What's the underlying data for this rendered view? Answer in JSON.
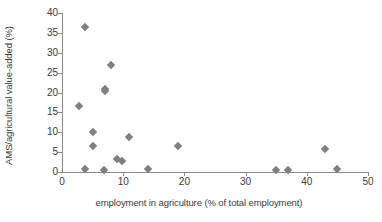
{
  "chart_data": {
    "type": "scatter",
    "title": "",
    "xlabel": "employment in agriculture (% of total employment)",
    "ylabel": "AMS/agricultural value-added (%)",
    "xlim": [
      0,
      50
    ],
    "ylim": [
      0,
      40
    ],
    "xticks": [
      0,
      10,
      20,
      30,
      40,
      50
    ],
    "yticks": [
      0,
      5,
      10,
      15,
      20,
      25,
      30,
      35,
      40
    ],
    "grid": false,
    "legend": false,
    "marker": {
      "shape": "diamond",
      "color": "#808080",
      "size": 6
    },
    "series": [
      {
        "name": "countries",
        "points": [
          {
            "x": 2.8,
            "y": 16.6
          },
          {
            "x": 3.7,
            "y": 36.5
          },
          {
            "x": 3.7,
            "y": 0.7
          },
          {
            "x": 5.0,
            "y": 10.0
          },
          {
            "x": 5.0,
            "y": 6.6
          },
          {
            "x": 6.8,
            "y": 0.6
          },
          {
            "x": 7.0,
            "y": 21.0
          },
          {
            "x": 7.0,
            "y": 20.4
          },
          {
            "x": 8.0,
            "y": 27.0
          },
          {
            "x": 9.0,
            "y": 3.2
          },
          {
            "x": 9.8,
            "y": 2.8
          },
          {
            "x": 11.0,
            "y": 8.9
          },
          {
            "x": 14.0,
            "y": 0.7
          },
          {
            "x": 19.0,
            "y": 6.5
          },
          {
            "x": 35.0,
            "y": 0.4
          },
          {
            "x": 37.0,
            "y": 0.6
          },
          {
            "x": 43.0,
            "y": 5.9
          },
          {
            "x": 45.0,
            "y": 0.8
          }
        ]
      }
    ]
  },
  "axes": {
    "x_tick_labels": [
      "0",
      "10",
      "20",
      "30",
      "40",
      "50"
    ],
    "y_tick_labels": [
      "0",
      "5",
      "10",
      "15",
      "20",
      "25",
      "30",
      "35",
      "40"
    ]
  },
  "colors": {
    "marker": "#808080",
    "axis": "#8a8a8a",
    "text": "#3a3a3a",
    "background": "#ffffff"
  }
}
